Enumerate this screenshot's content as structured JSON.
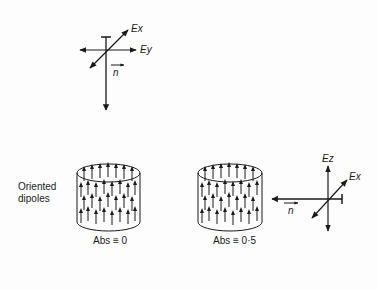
{
  "figure": {
    "top_axes": {
      "labels": {
        "ex": "Ex",
        "ey": "Ey",
        "n": "n"
      }
    },
    "side_label": {
      "line1": "Oriented",
      "line2": "dipoles"
    },
    "cylinder_left": {
      "caption": "Abs ≡ 0"
    },
    "cylinder_right": {
      "caption": "Abs ≡ 0·5"
    },
    "right_axes": {
      "labels": {
        "ez": "Ez",
        "ex": "Ex",
        "n": "n"
      }
    },
    "colors": {
      "ink": "#1a1a1a",
      "background": "#fdfdfd"
    }
  }
}
